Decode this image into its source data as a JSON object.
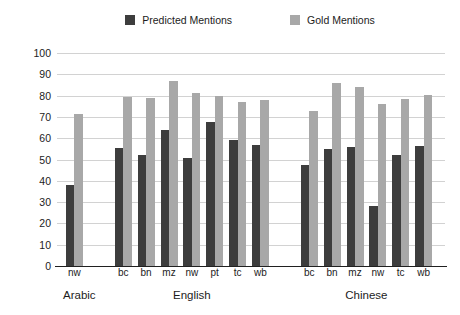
{
  "legend": {
    "position": "top-center",
    "items": [
      {
        "label": "Predicted Mentions",
        "color": "#3d3d3d",
        "key": "predicted"
      },
      {
        "label": "Gold Mentions",
        "color": "#a8a8a8",
        "key": "gold"
      }
    ]
  },
  "axes": {
    "ylabel": "CoNLL Average",
    "xlabel": "",
    "ylim": [
      0,
      100
    ],
    "yticks": [
      0,
      10,
      20,
      30,
      40,
      50,
      60,
      70,
      80,
      90,
      100
    ],
    "ytick_labels": [
      "0",
      "10",
      "20",
      "30",
      "40",
      "50",
      "60",
      "70",
      "80",
      "90",
      "100"
    ],
    "grid": true
  },
  "chart_data": {
    "type": "bar",
    "title": "",
    "xlabel": "",
    "ylabel": "CoNLL Average",
    "ylim": [
      0,
      100
    ],
    "grid": true,
    "legend_position": "top-center",
    "series": [
      {
        "name": "Predicted Mentions",
        "color": "#3d3d3d"
      },
      {
        "name": "Gold Mentions",
        "color": "#a8a8a8"
      }
    ],
    "groups": [
      {
        "name": "Arabic",
        "categories": [
          "nw"
        ],
        "values": {
          "predicted": [
            38
          ],
          "gold": [
            71.5
          ]
        }
      },
      {
        "name": "English",
        "categories": [
          "bc",
          "bn",
          "mz",
          "nw",
          "pt",
          "tc",
          "wb"
        ],
        "values": {
          "predicted": [
            55.5,
            52,
            64,
            50.5,
            67.5,
            59,
            57
          ],
          "gold": [
            79.5,
            79,
            87,
            81,
            80,
            77,
            78
          ]
        }
      },
      {
        "name": "Chinese",
        "categories": [
          "bc",
          "bn",
          "mz",
          "nw",
          "tc",
          "wb"
        ],
        "values": {
          "predicted": [
            47.5,
            55,
            56,
            28,
            52,
            56.5
          ],
          "gold": [
            73,
            86,
            84,
            76,
            78.5,
            80.5
          ]
        }
      }
    ]
  }
}
